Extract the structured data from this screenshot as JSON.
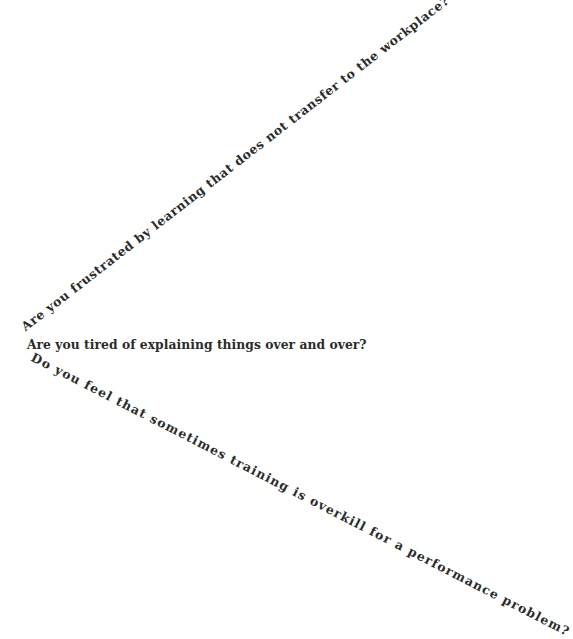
{
  "questions": [
    {
      "text": "Are you frustrated by learning that does not transfer to the workplace?",
      "orientation": "diagonal-up"
    },
    {
      "text": "Are you tired of explaining things over and over?",
      "orientation": "horizontal"
    },
    {
      "text": "Do you feel that sometimes training is overkill for a performance problem?",
      "orientation": "diagonal-down"
    }
  ],
  "colors": {
    "background": "#ffffff",
    "text": "#2b2b2b"
  }
}
